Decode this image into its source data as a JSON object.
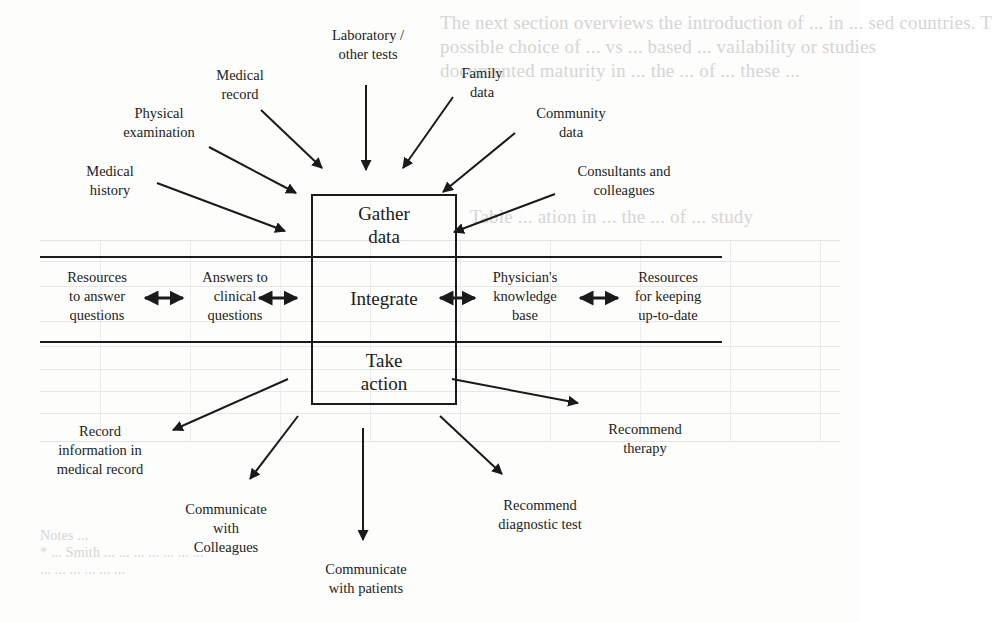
{
  "figure": {
    "type": "flow-diagram",
    "center_box": {
      "sections": [
        {
          "id": "gather",
          "lines": [
            "Gather",
            "data"
          ]
        },
        {
          "id": "integrate",
          "lines": [
            "Integrate"
          ]
        },
        {
          "id": "action",
          "lines": [
            "Take",
            "action"
          ]
        }
      ]
    },
    "inputs": [
      {
        "id": "laboratory",
        "lines": [
          "Laboratory /",
          "other tests"
        ]
      },
      {
        "id": "medical-record",
        "lines": [
          "Medical",
          "record"
        ]
      },
      {
        "id": "family",
        "lines": [
          "Family",
          "data"
        ]
      },
      {
        "id": "physical",
        "lines": [
          "Physical",
          "examination"
        ]
      },
      {
        "id": "community",
        "lines": [
          "Community",
          "data"
        ]
      },
      {
        "id": "history",
        "lines": [
          "Medical",
          "history"
        ]
      },
      {
        "id": "consultants",
        "lines": [
          "Consultants and",
          "colleagues"
        ]
      }
    ],
    "integrate_row": [
      {
        "id": "resources-answer",
        "lines": [
          "Resources",
          "to answer",
          "questions"
        ]
      },
      {
        "id": "answers-clinical",
        "lines": [
          "Answers to",
          "clinical",
          "questions"
        ]
      },
      {
        "id": "knowledge-base",
        "lines": [
          "Physician's",
          "knowledge",
          "base"
        ]
      },
      {
        "id": "resources-uptodate",
        "lines": [
          "Resources",
          "for keeping",
          "up-to-date"
        ]
      }
    ],
    "outputs": [
      {
        "id": "record-info",
        "lines": [
          "Record",
          "information in",
          "medical record"
        ]
      },
      {
        "id": "recommend-therapy",
        "lines": [
          "Recommend",
          "therapy"
        ]
      },
      {
        "id": "communicate-colleagues",
        "lines": [
          "Communicate",
          "with",
          "Colleagues"
        ]
      },
      {
        "id": "recommend-test",
        "lines": [
          "Recommend",
          "diagnostic test"
        ]
      },
      {
        "id": "communicate-patients",
        "lines": [
          "Communicate",
          "with patients"
        ]
      }
    ]
  },
  "bleed_through": {
    "lines": [
      "The next section overviews the introduction of ... in ... sed countries. T",
      "possible choice of ... vs ... based ... vailability or studies",
      "documented maturity in ... the ... of ... these ...",
      "Table ... ation in ... the ... of ... study",
      "Notes ... ",
      "* ... Smith ... ... ... ... ... ... ...",
      "... ... ... ... ... ..."
    ]
  },
  "colors": {
    "ink": "#1a1a1a",
    "paper": "#fdfdfc",
    "bleed": "#cfcfcf"
  }
}
